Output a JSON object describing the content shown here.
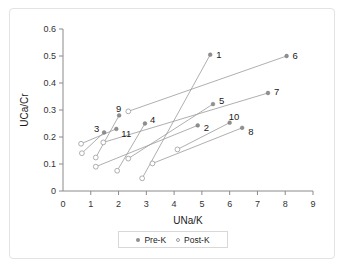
{
  "chart_data": {
    "type": "scatter",
    "title": "",
    "xlabel": "UNa/K",
    "ylabel": "UCa/Cr",
    "xlim": [
      0,
      9
    ],
    "ylim": [
      0,
      0.6
    ],
    "xticks": [
      "0",
      "1",
      "2",
      "3",
      "4",
      "5",
      "6",
      "7",
      "8",
      "9"
    ],
    "yticks": [
      "0",
      "0.1",
      "0.2",
      "0.3",
      "0.4",
      "0.5",
      "0.6"
    ],
    "grid": false,
    "legend_position": "bottom",
    "legend": [
      {
        "name": "Pre-K",
        "marker": "filled-circle",
        "color": "#8f8f8f"
      },
      {
        "name": "Post-K",
        "marker": "open-circle",
        "color": "#9b9b9b"
      }
    ],
    "series": [
      {
        "name": "Pre-K",
        "marker": "filled-circle"
      },
      {
        "name": "Post-K",
        "marker": "open-circle"
      }
    ],
    "pairs": [
      {
        "label": "1",
        "pre": {
          "x": 5.3,
          "y": 0.505
        },
        "post": {
          "x": 2.85,
          "y": 0.047
        }
      },
      {
        "label": "2",
        "pre": {
          "x": 4.85,
          "y": 0.243
        },
        "post": {
          "x": 1.18,
          "y": 0.09
        }
      },
      {
        "label": "3",
        "pre": {
          "x": 1.48,
          "y": 0.217
        },
        "post": {
          "x": 0.68,
          "y": 0.14
        }
      },
      {
        "label": "4",
        "pre": {
          "x": 2.95,
          "y": 0.25
        },
        "post": {
          "x": 1.95,
          "y": 0.075
        }
      },
      {
        "label": "5",
        "pre": {
          "x": 5.4,
          "y": 0.322
        },
        "post": {
          "x": 2.35,
          "y": 0.12
        }
      },
      {
        "label": "6",
        "pre": {
          "x": 8.05,
          "y": 0.5
        },
        "post": {
          "x": 2.35,
          "y": 0.295
        }
      },
      {
        "label": "7",
        "pre": {
          "x": 7.38,
          "y": 0.363
        },
        "post": {
          "x": 1.45,
          "y": 0.18
        }
      },
      {
        "label": "8",
        "pre": {
          "x": 6.45,
          "y": 0.234
        },
        "post": {
          "x": 3.22,
          "y": 0.102
        }
      },
      {
        "label": "9",
        "pre": {
          "x": 2.02,
          "y": 0.28
        },
        "post": {
          "x": 1.18,
          "y": 0.124
        }
      },
      {
        "label": "10",
        "pre": {
          "x": 6.0,
          "y": 0.253
        },
        "post": {
          "x": 4.12,
          "y": 0.154
        }
      },
      {
        "label": "11",
        "pre": {
          "x": 1.92,
          "y": 0.23
        },
        "post": {
          "x": 0.65,
          "y": 0.175
        }
      }
    ],
    "label_offsets": [
      {
        "label": "1",
        "dx": 6,
        "dy": 0
      },
      {
        "label": "2",
        "dx": 6,
        "dy": 3
      },
      {
        "label": "3",
        "dx": -10,
        "dy": -3
      },
      {
        "label": "4",
        "dx": 5,
        "dy": -4
      },
      {
        "label": "5",
        "dx": 6,
        "dy": -3
      },
      {
        "label": "6",
        "dx": 6,
        "dy": 0
      },
      {
        "label": "7",
        "dx": 6,
        "dy": -1
      },
      {
        "label": "8",
        "dx": 6,
        "dy": 4
      },
      {
        "label": "9",
        "dx": -3,
        "dy": -6
      },
      {
        "label": "10",
        "dx": -1,
        "dy": -6
      },
      {
        "label": "11",
        "dx": 5,
        "dy": 5
      }
    ]
  },
  "legend": {
    "pre_label": "Pre-K",
    "post_label": "Post-K"
  },
  "axes": {
    "x_title": "UNa/K",
    "y_title": "UCa/Cr"
  }
}
